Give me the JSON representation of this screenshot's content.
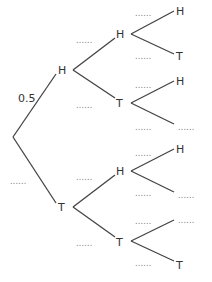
{
  "diagram": {
    "type": "probability-tree",
    "root": {
      "branches": [
        {
          "outcome": "H",
          "probability": "0.5",
          "children": [
            {
              "outcome": "H",
              "probability": "......",
              "children": [
                {
                  "outcome": "H",
                  "probability": "......"
                },
                {
                  "outcome": "T",
                  "probability": "......"
                }
              ]
            },
            {
              "outcome": "T",
              "probability": "......",
              "children": [
                {
                  "outcome": "H",
                  "probability": "......"
                },
                {
                  "outcome": "......",
                  "probability": "......"
                }
              ]
            }
          ]
        },
        {
          "outcome": "T",
          "probability": "......",
          "children": [
            {
              "outcome": "H",
              "probability": "......",
              "children": [
                {
                  "outcome": "H",
                  "probability": "......"
                },
                {
                  "outcome": "......",
                  "probability": "......"
                }
              ]
            },
            {
              "outcome": "T",
              "probability": "......",
              "children": [
                {
                  "outcome": "......",
                  "probability": "......"
                },
                {
                  "outcome": "T",
                  "probability": "......"
                }
              ]
            }
          ]
        }
      ]
    }
  },
  "colors": {
    "lines": "#444444",
    "text": "#333333",
    "dots": "#777777",
    "background": "#ffffff"
  }
}
